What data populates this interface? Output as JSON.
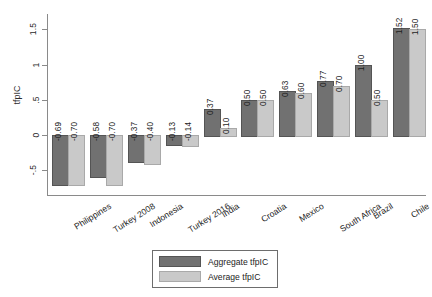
{
  "chart_data": {
    "type": "bar",
    "title": "",
    "xlabel": "",
    "ylabel": "tfpIC",
    "ylim": [
      -0.85,
      1.72
    ],
    "yticks": [
      1.5,
      1,
      0.5,
      0,
      -0.5
    ],
    "ytick_labels": [
      "1.5",
      "1",
      ".5",
      "0",
      "-.5"
    ],
    "grid": false,
    "legend_position": "bottom-center",
    "categories": [
      "Philippines",
      "Turkey 2008",
      "Indonesia",
      "Turkey 2016",
      "India",
      "Croatia",
      "Mexico",
      "South Africa",
      "Brazil",
      "Chile"
    ],
    "series": [
      {
        "name": "Aggregate tfpIC",
        "color": "#717171",
        "values": [
          -0.69,
          -0.58,
          -0.37,
          -0.13,
          0.37,
          0.5,
          0.63,
          0.77,
          1.0,
          1.52
        ],
        "labels": [
          "-0.69",
          "-0.58",
          "-0.37",
          "-0.13",
          "0.37",
          "0.50",
          "0.63",
          "0.77",
          "1.00",
          "1.52"
        ]
      },
      {
        "name": "Average tfpIC",
        "color": "#c9c9c9",
        "values": [
          -0.7,
          -0.7,
          -0.4,
          -0.14,
          0.1,
          0.5,
          0.6,
          0.7,
          0.5,
          1.5
        ],
        "labels": [
          "-0.70",
          "-0.70",
          "-0.40",
          "-0.14",
          "0.10",
          "0.50",
          "0.60",
          "0.70",
          "0.50",
          "1.50"
        ]
      }
    ]
  },
  "legend": {
    "items": [
      {
        "label": "Aggregate tfpIC"
      },
      {
        "label": "Average tfpIC"
      }
    ]
  }
}
